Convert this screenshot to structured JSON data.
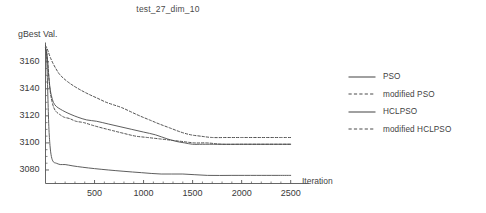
{
  "chart_data": {
    "type": "line",
    "title": "test_27_dim_10",
    "xlabel": "Iteration",
    "ylabel": "gBest Val.",
    "xlim": [
      0,
      2600
    ],
    "ylim": [
      3070,
      3172
    ],
    "grid": false,
    "legend_position": "right",
    "xticks": [
      500,
      1000,
      1500,
      2000,
      2500
    ],
    "yticks": [
      3080,
      3100,
      3120,
      3140,
      3160
    ],
    "series": [
      {
        "name": "PSO",
        "style": "solid",
        "color": "#555555",
        "x": [
          0,
          10,
          20,
          30,
          45,
          60,
          80,
          110,
          150,
          200,
          260,
          330,
          420,
          520,
          640,
          760,
          880,
          1000,
          1120,
          1240,
          1340,
          1420,
          1500,
          1600,
          1750,
          1900,
          2100,
          2300,
          2500
        ],
        "y": [
          3170,
          3168,
          3162,
          3152,
          3141,
          3135,
          3130,
          3127,
          3125,
          3123,
          3121,
          3119,
          3117,
          3116,
          3114,
          3112,
          3110,
          3108,
          3106,
          3103,
          3101,
          3100,
          3099,
          3099,
          3099,
          3099,
          3099,
          3099,
          3099
        ]
      },
      {
        "name": "modified PSO",
        "style": "dashed",
        "color": "#4a4a4a",
        "x": [
          0,
          15,
          30,
          50,
          75,
          105,
          140,
          180,
          230,
          290,
          360,
          440,
          530,
          620,
          700,
          780,
          870,
          960,
          1060,
          1160,
          1270,
          1380,
          1480,
          1580,
          1700,
          1850,
          2000,
          2200,
          2400,
          2500
        ],
        "y": [
          3172,
          3170,
          3167,
          3163,
          3159,
          3155,
          3151,
          3148,
          3145,
          3142,
          3139,
          3136,
          3133,
          3130,
          3128,
          3126,
          3123,
          3120,
          3117,
          3114,
          3111,
          3108,
          3106,
          3105,
          3104,
          3104,
          3104,
          3104,
          3104,
          3104
        ]
      },
      {
        "name": "HCLPSO",
        "style": "solid",
        "color": "#555555",
        "x": [
          0,
          8,
          16,
          24,
          34,
          46,
          60,
          80,
          110,
          150,
          200,
          280,
          380,
          500,
          640,
          800,
          980,
          1180,
          1400,
          1650,
          1900,
          2150,
          2350,
          2500
        ],
        "y": [
          3170,
          3166,
          3155,
          3135,
          3112,
          3098,
          3090,
          3086,
          3085,
          3084,
          3084,
          3083,
          3082,
          3081,
          3080,
          3079,
          3078,
          3077,
          3077,
          3076,
          3076,
          3076,
          3076,
          3076
        ]
      },
      {
        "name": "modified HCLPSO",
        "style": "dashed",
        "color": "#4a4a4a",
        "x": [
          0,
          10,
          22,
          34,
          48,
          65,
          85,
          110,
          145,
          190,
          245,
          310,
          390,
          480,
          580,
          690,
          800,
          920,
          1040,
          1160,
          1280,
          1400,
          1520,
          1650,
          1800,
          2000,
          2200,
          2400,
          2500
        ],
        "y": [
          3170,
          3167,
          3160,
          3149,
          3138,
          3131,
          3126,
          3123,
          3121,
          3119,
          3118,
          3116,
          3115,
          3113,
          3111,
          3109,
          3107,
          3105,
          3104,
          3103,
          3102,
          3101,
          3100,
          3100,
          3099,
          3099,
          3099,
          3099,
          3099
        ]
      }
    ]
  },
  "legend": {
    "items": [
      {
        "label": "PSO",
        "style": "solid"
      },
      {
        "label": "modified PSO",
        "style": "dashed"
      },
      {
        "label": "HCLPSO",
        "style": "solid"
      },
      {
        "label": "modified HCLPSO",
        "style": "dashed"
      }
    ]
  },
  "colors": {
    "axis": "#555555",
    "text": "#3a3a3a",
    "background": "#ffffff"
  }
}
